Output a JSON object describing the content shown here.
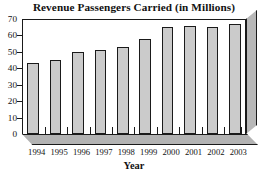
{
  "chart_data": {
    "type": "bar",
    "title": "Revenue Passengers Carried (in Millions)",
    "xlabel": "Year",
    "ylabel": "",
    "categories": [
      "1994",
      "1995",
      "1996",
      "1997",
      "1998",
      "1999",
      "2000",
      "2001",
      "2002",
      "2003"
    ],
    "values": [
      43,
      45,
      50,
      51,
      53,
      58,
      65,
      66,
      65,
      67
    ],
    "ylim": [
      0,
      70
    ],
    "yticks": [
      0,
      10,
      20,
      30,
      40,
      50,
      60,
      70
    ],
    "ytick_labels": [
      "0",
      "10",
      "20",
      "30",
      "40",
      "50",
      "60",
      "70"
    ],
    "grid": false,
    "legend": false,
    "style": "3d-bar",
    "colors": {
      "bar_fill": "#cbcbcb",
      "bar_outline": "#1a1a1a",
      "floor": "#b3b3b3",
      "side_wall": "#b8b8b8",
      "background": "#ffffff",
      "text": "#111111"
    }
  }
}
